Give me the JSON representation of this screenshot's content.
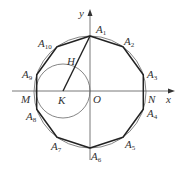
{
  "diagram": {
    "axes": {
      "x_label": "x",
      "y_label": "y",
      "origin_label": "O"
    },
    "points": {
      "M": "M",
      "N": "N",
      "K": "K",
      "H": "H"
    },
    "vertices": [
      {
        "base": "A",
        "sub": "1"
      },
      {
        "base": "A",
        "sub": "2"
      },
      {
        "base": "A",
        "sub": "3"
      },
      {
        "base": "A",
        "sub": "4"
      },
      {
        "base": "A",
        "sub": "5"
      },
      {
        "base": "A",
        "sub": "6"
      },
      {
        "base": "A",
        "sub": "7"
      },
      {
        "base": "A",
        "sub": "8"
      },
      {
        "base": "A",
        "sub": "9"
      },
      {
        "base": "A",
        "sub": "10"
      }
    ],
    "colors": {
      "stroke": "#222222",
      "thin": "#555555"
    }
  }
}
